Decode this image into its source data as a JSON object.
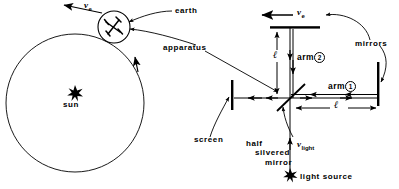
{
  "figure": {
    "stroke_color": "#000000",
    "background_color": "#ffffff"
  },
  "left_diagram": {
    "name": "earth-orbit-around-sun",
    "labels": {
      "earth": "earth",
      "apparatus": "apparatus",
      "sun": "sun",
      "velocity_symbol": "v",
      "velocity_subscript": "e"
    },
    "orbit": {
      "center_x": 75,
      "center_y": 103,
      "radius": 69,
      "direction": "counterclockwise"
    },
    "sun_marker": {
      "x": 75,
      "y": 92,
      "glyph": "star"
    },
    "earth_body": {
      "x": 114,
      "y": 27,
      "radius": 16
    }
  },
  "right_diagram": {
    "name": "michelson-interferometer",
    "labels": {
      "earth_velocity_symbol": "v",
      "earth_velocity_subscript": "e",
      "mirrors": "mirrors",
      "arm1_text": "arm",
      "arm1_number": "1",
      "arm2_text": "arm",
      "arm2_number": "2",
      "length_vertical": "ℓ",
      "length_horizontal": "ℓ",
      "screen": "screen",
      "half_silvered_mirror_line1": "half",
      "half_silvered_mirror_line2": "silvered",
      "half_silvered_mirror_line3": "mirror",
      "light_velocity_symbol": "v",
      "light_velocity_subscript": "light",
      "light_source": "light source"
    },
    "geometry": {
      "beam_splitter_x": 290,
      "beam_splitter_y": 98,
      "top_mirror_y": 28,
      "right_mirror_x": 378,
      "screen_x": 232,
      "light_source_y": 176,
      "arm_length_label": "ℓ"
    }
  }
}
